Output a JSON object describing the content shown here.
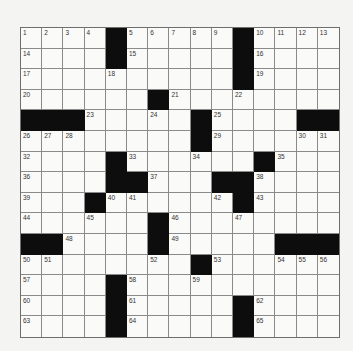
{
  "puzzle": {
    "rows": 15,
    "cols": 15,
    "colors": {
      "background": "#f4f4f2",
      "cell": "#fafaf8",
      "block": "#0d0d0d",
      "line": "#8a8a8a"
    },
    "grid": [
      "....#.....#....",
      "....#.....#....",
      "..........#....",
      "......#........",
      "###.....#....##",
      "........#......",
      "....#......#...",
      "....##...##....",
      "...#......#....",
      "......#........",
      "##....#.....###",
      "........#......",
      "....#..........",
      "....#.....#....",
      "....#.....#...."
    ],
    "numbers": [
      {
        "r": 0,
        "c": 0,
        "n": "1"
      },
      {
        "r": 0,
        "c": 1,
        "n": "2"
      },
      {
        "r": 0,
        "c": 2,
        "n": "3"
      },
      {
        "r": 0,
        "c": 3,
        "n": "4"
      },
      {
        "r": 0,
        "c": 5,
        "n": "5"
      },
      {
        "r": 0,
        "c": 6,
        "n": "6"
      },
      {
        "r": 0,
        "c": 7,
        "n": "7"
      },
      {
        "r": 0,
        "c": 8,
        "n": "8"
      },
      {
        "r": 0,
        "c": 9,
        "n": "9"
      },
      {
        "r": 0,
        "c": 11,
        "n": "10"
      },
      {
        "r": 0,
        "c": 12,
        "n": "11"
      },
      {
        "r": 0,
        "c": 13,
        "n": "12"
      },
      {
        "r": 0,
        "c": 14,
        "n": "13"
      },
      {
        "r": 1,
        "c": 0,
        "n": "14"
      },
      {
        "r": 1,
        "c": 5,
        "n": "15"
      },
      {
        "r": 1,
        "c": 11,
        "n": "16"
      },
      {
        "r": 2,
        "c": 0,
        "n": "17"
      },
      {
        "r": 2,
        "c": 4,
        "n": "18"
      },
      {
        "r": 2,
        "c": 11,
        "n": "19"
      },
      {
        "r": 3,
        "c": 0,
        "n": "20"
      },
      {
        "r": 3,
        "c": 7,
        "n": "21"
      },
      {
        "r": 3,
        "c": 10,
        "n": "22"
      },
      {
        "r": 4,
        "c": 3,
        "n": "23"
      },
      {
        "r": 4,
        "c": 6,
        "n": "24"
      },
      {
        "r": 4,
        "c": 9,
        "n": "25"
      },
      {
        "r": 5,
        "c": 0,
        "n": "26"
      },
      {
        "r": 5,
        "c": 1,
        "n": "27"
      },
      {
        "r": 5,
        "c": 2,
        "n": "28"
      },
      {
        "r": 5,
        "c": 9,
        "n": "29"
      },
      {
        "r": 5,
        "c": 13,
        "n": "30"
      },
      {
        "r": 5,
        "c": 14,
        "n": "31"
      },
      {
        "r": 6,
        "c": 0,
        "n": "32"
      },
      {
        "r": 6,
        "c": 5,
        "n": "33"
      },
      {
        "r": 6,
        "c": 8,
        "n": "34"
      },
      {
        "r": 6,
        "c": 12,
        "n": "35"
      },
      {
        "r": 7,
        "c": 0,
        "n": "36"
      },
      {
        "r": 7,
        "c": 6,
        "n": "37"
      },
      {
        "r": 7,
        "c": 11,
        "n": "38"
      },
      {
        "r": 8,
        "c": 0,
        "n": "39"
      },
      {
        "r": 8,
        "c": 4,
        "n": "40"
      },
      {
        "r": 8,
        "c": 5,
        "n": "41"
      },
      {
        "r": 8,
        "c": 9,
        "n": "42"
      },
      {
        "r": 8,
        "c": 11,
        "n": "43"
      },
      {
        "r": 9,
        "c": 0,
        "n": "44"
      },
      {
        "r": 9,
        "c": 3,
        "n": "45"
      },
      {
        "r": 9,
        "c": 7,
        "n": "46"
      },
      {
        "r": 9,
        "c": 10,
        "n": "47"
      },
      {
        "r": 10,
        "c": 2,
        "n": "48"
      },
      {
        "r": 10,
        "c": 7,
        "n": "49"
      },
      {
        "r": 11,
        "c": 0,
        "n": "50"
      },
      {
        "r": 11,
        "c": 1,
        "n": "51"
      },
      {
        "r": 11,
        "c": 6,
        "n": "52"
      },
      {
        "r": 11,
        "c": 9,
        "n": "53"
      },
      {
        "r": 11,
        "c": 12,
        "n": "54"
      },
      {
        "r": 11,
        "c": 13,
        "n": "55"
      },
      {
        "r": 11,
        "c": 14,
        "n": "56"
      },
      {
        "r": 12,
        "c": 0,
        "n": "57"
      },
      {
        "r": 12,
        "c": 5,
        "n": "58"
      },
      {
        "r": 12,
        "c": 8,
        "n": "59"
      },
      {
        "r": 13,
        "c": 0,
        "n": "60"
      },
      {
        "r": 13,
        "c": 5,
        "n": "61"
      },
      {
        "r": 13,
        "c": 11,
        "n": "62"
      },
      {
        "r": 14,
        "c": 0,
        "n": "63"
      },
      {
        "r": 14,
        "c": 5,
        "n": "64"
      },
      {
        "r": 14,
        "c": 11,
        "n": "65"
      }
    ]
  }
}
